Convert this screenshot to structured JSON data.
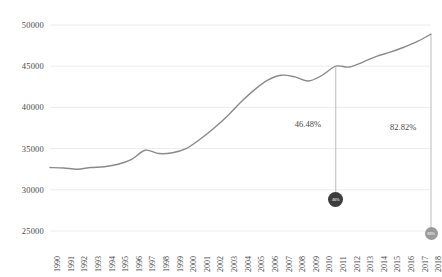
{
  "chart_data": {
    "type": "line",
    "title": "",
    "subtitle": "",
    "xlabel": "",
    "ylabel": "",
    "grid": true,
    "legend_position": "none",
    "ylim": [
      25000,
      50000
    ],
    "yticks": [
      25000,
      30000,
      35000,
      40000,
      45000,
      50000
    ],
    "ytick_labels": [
      "25000",
      "30000",
      "35000",
      "40000",
      "45000",
      "50000"
    ],
    "x": [
      1990,
      1991,
      1992,
      1993,
      1994,
      1995,
      1996,
      1997,
      1998,
      1999,
      2000,
      2001,
      2002,
      2003,
      2004,
      2005,
      2006,
      2007,
      2008,
      2009,
      2010,
      2011,
      2012,
      2013,
      2014,
      2015,
      2016,
      2017,
      2018
    ],
    "xtick_labels": [
      "1990",
      "1991",
      "1992",
      "1993",
      "1994",
      "1995",
      "1996",
      "1997",
      "1998",
      "1999",
      "2000",
      "2001",
      "2002",
      "2003",
      "2004",
      "2005",
      "2006",
      "2007",
      "2008",
      "2009",
      "2010",
      "2011",
      "2012",
      "2013",
      "2014",
      "2015",
      "2016",
      "2017",
      "2018"
    ],
    "series": [
      {
        "name": "value",
        "color": "#8a8a8a",
        "values": [
          32700,
          32650,
          32500,
          32700,
          32800,
          33100,
          33700,
          34800,
          34400,
          34500,
          35000,
          36100,
          37400,
          38900,
          40600,
          42100,
          43300,
          43900,
          43700,
          43200,
          43900,
          45000,
          44900,
          45500,
          46200,
          46700,
          47300,
          48000,
          48900
        ]
      }
    ],
    "annotations": [
      {
        "label": "46.48%",
        "x": 2011,
        "y": 45000,
        "marker_label": "46%",
        "marker_color": "#3d3d3d"
      },
      {
        "label": "82.82%",
        "x": 2018,
        "y": 48900,
        "marker_label": "83%",
        "marker_color": "#9a9a9a"
      }
    ]
  },
  "colors": {
    "line": "#8a8a8a",
    "grid": "#ececec",
    "text": "#4a4a4a",
    "leader": "#bcbcbc",
    "marker_dark": "#3d3d3d",
    "marker_light": "#9a9a9a",
    "background": "#ffffff"
  }
}
